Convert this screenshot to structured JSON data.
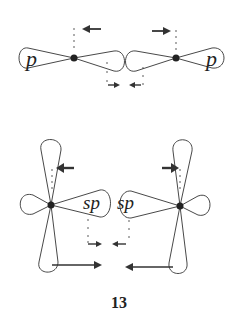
{
  "diagram": {
    "top": {
      "left_label": "p",
      "right_label": "p"
    },
    "bottom": {
      "left_label": "sp",
      "right_label": "sp"
    },
    "caption": "13",
    "colors": {
      "stroke": "#333333",
      "nucleus": "#222222",
      "background": "#ffffff"
    }
  }
}
